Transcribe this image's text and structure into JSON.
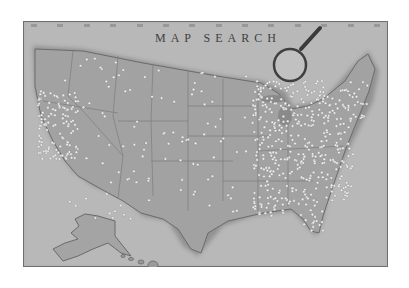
{
  "image": {
    "title": "MAP SEARCH",
    "subject": "vintage map of the United States with pins",
    "palette": {
      "background": "#ffffff",
      "frame": "#7d7d7d",
      "paper": "#a9a9a9",
      "ocean": "#bdbdbd",
      "land": "#9c9c9c",
      "borders": "#7a7a7a",
      "pins": "#eeeeee"
    },
    "elements": [
      "frame",
      "title",
      "top-tick-marks",
      "magnifying-glass",
      "contiguous-us-map",
      "alaska",
      "hawaii",
      "pins"
    ],
    "tick_count": 14
  }
}
